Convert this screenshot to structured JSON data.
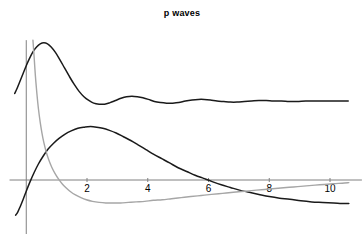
{
  "chart_data": {
    "type": "line",
    "title": "p waves",
    "xlabel": "r",
    "ylabel": "",
    "xlim": [
      -0.55,
      11.2
    ],
    "ylim": [
      -1.32,
      2.62
    ],
    "xticks": [
      2,
      4,
      6,
      8,
      10
    ],
    "xtick_labels": [
      "2",
      "4",
      "6",
      "8",
      "10"
    ],
    "yticks": [],
    "ytick_labels": [],
    "grid": false,
    "legend": null,
    "axis_color": "#808080",
    "series": [
      {
        "name": "upper-oscillating-curve",
        "color": "#1a1a1a",
        "width": 1.5,
        "points": [
          [
            -0.38,
            1.62
          ],
          [
            -0.3,
            1.72
          ],
          [
            -0.2,
            1.86
          ],
          [
            -0.1,
            2.0
          ],
          [
            0.0,
            2.14
          ],
          [
            0.1,
            2.27
          ],
          [
            0.22,
            2.4
          ],
          [
            0.34,
            2.49
          ],
          [
            0.46,
            2.55
          ],
          [
            0.58,
            2.57
          ],
          [
            0.7,
            2.55
          ],
          [
            0.82,
            2.49
          ],
          [
            0.96,
            2.39
          ],
          [
            1.1,
            2.26
          ],
          [
            1.26,
            2.1
          ],
          [
            1.42,
            1.94
          ],
          [
            1.58,
            1.79
          ],
          [
            1.74,
            1.66
          ],
          [
            1.9,
            1.56
          ],
          [
            2.06,
            1.49
          ],
          [
            2.22,
            1.44
          ],
          [
            2.4,
            1.42
          ],
          [
            2.58,
            1.42
          ],
          [
            2.76,
            1.45
          ],
          [
            2.94,
            1.49
          ],
          [
            3.12,
            1.53
          ],
          [
            3.3,
            1.56
          ],
          [
            3.48,
            1.57
          ],
          [
            3.66,
            1.56
          ],
          [
            3.84,
            1.54
          ],
          [
            4.02,
            1.51
          ],
          [
            4.22,
            1.47
          ],
          [
            4.42,
            1.45
          ],
          [
            4.62,
            1.44
          ],
          [
            4.82,
            1.44
          ],
          [
            5.02,
            1.45
          ],
          [
            5.24,
            1.48
          ],
          [
            5.46,
            1.5
          ],
          [
            5.66,
            1.51
          ],
          [
            5.86,
            1.51
          ],
          [
            6.06,
            1.5
          ],
          [
            6.28,
            1.48
          ],
          [
            6.5,
            1.47
          ],
          [
            6.72,
            1.46
          ],
          [
            6.94,
            1.46
          ],
          [
            7.18,
            1.47
          ],
          [
            7.42,
            1.48
          ],
          [
            7.66,
            1.49
          ],
          [
            7.9,
            1.49
          ],
          [
            8.14,
            1.48
          ],
          [
            8.4,
            1.48
          ],
          [
            8.66,
            1.47
          ],
          [
            8.92,
            1.47
          ],
          [
            9.2,
            1.48
          ],
          [
            9.48,
            1.48
          ],
          [
            9.76,
            1.48
          ],
          [
            10.04,
            1.48
          ],
          [
            10.32,
            1.48
          ],
          [
            10.6,
            1.48
          ]
        ]
      },
      {
        "name": "lower-dark-curve",
        "color": "#1a1a1a",
        "width": 1.5,
        "points": [
          [
            -0.35,
            -0.66
          ],
          [
            -0.28,
            -0.6
          ],
          [
            -0.2,
            -0.5
          ],
          [
            -0.1,
            -0.36
          ],
          [
            0.0,
            -0.21
          ],
          [
            0.12,
            -0.04
          ],
          [
            0.26,
            0.14
          ],
          [
            0.4,
            0.3
          ],
          [
            0.56,
            0.45
          ],
          [
            0.72,
            0.58
          ],
          [
            0.9,
            0.69
          ],
          [
            1.08,
            0.78
          ],
          [
            1.28,
            0.86
          ],
          [
            1.48,
            0.92
          ],
          [
            1.7,
            0.97
          ],
          [
            1.92,
            0.99
          ],
          [
            2.12,
            1.0
          ],
          [
            2.32,
            0.99
          ],
          [
            2.52,
            0.97
          ],
          [
            2.74,
            0.93
          ],
          [
            2.96,
            0.88
          ],
          [
            3.2,
            0.81
          ],
          [
            3.44,
            0.74
          ],
          [
            3.68,
            0.66
          ],
          [
            3.94,
            0.57
          ],
          [
            4.2,
            0.48
          ],
          [
            4.46,
            0.4
          ],
          [
            4.72,
            0.32
          ],
          [
            5.0,
            0.23
          ],
          [
            5.28,
            0.16
          ],
          [
            5.56,
            0.09
          ],
          [
            5.84,
            0.03
          ],
          [
            6.12,
            -0.03
          ],
          [
            6.42,
            -0.09
          ],
          [
            6.72,
            -0.14
          ],
          [
            7.02,
            -0.19
          ],
          [
            7.34,
            -0.23
          ],
          [
            7.66,
            -0.27
          ],
          [
            8.0,
            -0.31
          ],
          [
            8.34,
            -0.34
          ],
          [
            8.68,
            -0.36
          ],
          [
            9.04,
            -0.39
          ],
          [
            9.4,
            -0.41
          ],
          [
            9.76,
            -0.42
          ],
          [
            10.12,
            -0.43
          ],
          [
            10.48,
            -0.44
          ],
          [
            10.62,
            -0.44
          ]
        ]
      },
      {
        "name": "gray-decaying-curve",
        "color": "#a6a6a6",
        "width": 1.4,
        "points": [
          [
            0.22,
            2.62
          ],
          [
            0.26,
            2.3
          ],
          [
            0.3,
            1.96
          ],
          [
            0.35,
            1.62
          ],
          [
            0.4,
            1.34
          ],
          [
            0.46,
            1.08
          ],
          [
            0.52,
            0.87
          ],
          [
            0.58,
            0.7
          ],
          [
            0.66,
            0.52
          ],
          [
            0.74,
            0.38
          ],
          [
            0.84,
            0.24
          ],
          [
            0.94,
            0.13
          ],
          [
            1.06,
            0.02
          ],
          [
            1.18,
            -0.07
          ],
          [
            1.32,
            -0.15
          ],
          [
            1.46,
            -0.22
          ],
          [
            1.62,
            -0.28
          ],
          [
            1.8,
            -0.33
          ],
          [
            1.98,
            -0.37
          ],
          [
            2.18,
            -0.4
          ],
          [
            2.4,
            -0.42
          ],
          [
            2.62,
            -0.43
          ],
          [
            2.86,
            -0.43
          ],
          [
            3.1,
            -0.43
          ],
          [
            3.36,
            -0.42
          ],
          [
            3.62,
            -0.41
          ],
          [
            3.9,
            -0.4
          ],
          [
            4.18,
            -0.38
          ],
          [
            4.48,
            -0.37
          ],
          [
            4.78,
            -0.35
          ],
          [
            5.1,
            -0.33
          ],
          [
            5.42,
            -0.31
          ],
          [
            5.76,
            -0.29
          ],
          [
            6.1,
            -0.27
          ],
          [
            6.46,
            -0.25
          ],
          [
            6.82,
            -0.23
          ],
          [
            7.2,
            -0.21
          ],
          [
            7.58,
            -0.19
          ],
          [
            7.98,
            -0.17
          ],
          [
            8.38,
            -0.15
          ],
          [
            8.8,
            -0.13
          ],
          [
            9.22,
            -0.11
          ],
          [
            9.66,
            -0.09
          ],
          [
            10.1,
            -0.07
          ],
          [
            10.4,
            -0.06
          ],
          [
            10.62,
            -0.05
          ]
        ]
      }
    ],
    "yaxis_line": {
      "x": 0.0,
      "y_from": -1.32,
      "y_to": 2.62
    },
    "xaxis_line": {
      "y": 0.0,
      "x_from": -0.55,
      "x_to": 11.05
    }
  }
}
